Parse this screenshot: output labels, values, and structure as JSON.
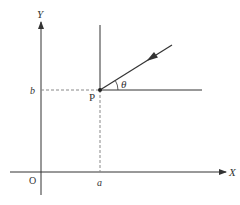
{
  "diagram": {
    "axes": {
      "x_label": "X",
      "y_label": "Y",
      "origin_label": "O"
    },
    "point": {
      "label": "P",
      "x_coord_label": "a",
      "y_coord_label": "b"
    },
    "angle_label": "θ",
    "colors": {
      "line": "#333333",
      "dashed": "#888888",
      "background": "#ffffff"
    }
  }
}
